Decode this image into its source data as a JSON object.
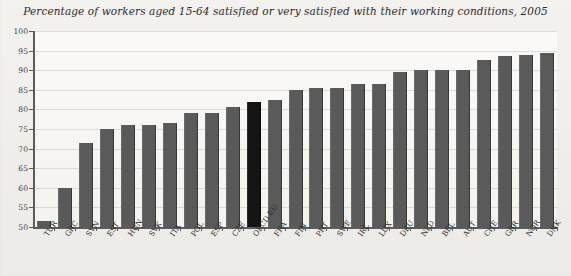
{
  "chart_data": {
    "type": "bar",
    "title": "Percentage of workers aged 15-64 satisfied or very satisfied with their working conditions, 2005",
    "xlabel": "",
    "ylabel": "",
    "ylim": [
      50,
      100
    ],
    "ytick_step": 5,
    "yticks": [
      100,
      95,
      90,
      85,
      80,
      75,
      70,
      65,
      60,
      55,
      50
    ],
    "grid": true,
    "legend": "none",
    "highlight_category": "OECD EU",
    "colors": {
      "bar": "#5a5a5a",
      "highlight_bar": "#141414",
      "background": "#f1efeb",
      "plot_background": "#f6f4f1",
      "axis": "#5c5c5c",
      "gridline": "#aaa8a3",
      "text": "#2b2b2b"
    },
    "categories": [
      "TUR",
      "GRC",
      "SVN",
      "EST",
      "HUN",
      "SVK",
      "ITA",
      "POL",
      "ESP",
      "CZE",
      "OECD EU",
      "FRA",
      "FIN",
      "PRT",
      "SWE",
      "IRL",
      "LUX",
      "DEU",
      "NLD",
      "BEL",
      "AUT",
      "CHE",
      "GBR",
      "NOR",
      "DNK"
    ],
    "values": [
      51.5,
      60,
      71.5,
      75,
      76,
      76,
      76.5,
      79,
      79,
      80.5,
      82,
      82.5,
      85,
      85.5,
      85.5,
      86.5,
      86.5,
      89.5,
      90,
      90,
      90,
      92.5,
      93.5,
      94,
      94.5
    ]
  }
}
